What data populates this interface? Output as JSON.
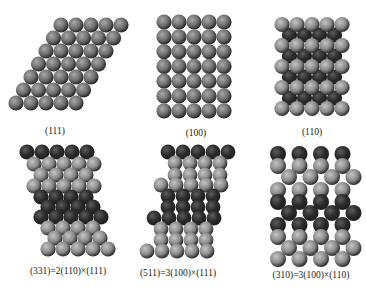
{
  "colors": {
    "background": "#ffffff",
    "atom_light": "#8a8a8a",
    "atom_light_hi": "#c4c4c4",
    "atom_mid": "#6e6e6e",
    "atom_mid_hi": "#a8a8a8",
    "atom_dark": "#2a2a2a",
    "atom_dark_hi": "#5c5c5c",
    "label": "#1a1a1a"
  },
  "panels": [
    {
      "id": "p111",
      "label": "(111)",
      "label_x": 55,
      "label_y": 126,
      "atom_radius": 7.6,
      "atoms": {
        "type": "hex",
        "rows": 7,
        "cols": 5,
        "x0": 61,
        "y0": 25,
        "dx": 15,
        "dy": 13,
        "row_shift": -7.5,
        "tone": "mid"
      }
    },
    {
      "id": "p100",
      "label": "(100)",
      "label_x": 196,
      "label_y": 128,
      "atom_radius": 7.6,
      "atoms": {
        "type": "square",
        "rows": 7,
        "cols": 5,
        "x0": 164,
        "y0": 22,
        "dx": 15,
        "dy": 14.8,
        "tone": "mid"
      }
    },
    {
      "id": "p110",
      "label": "(110)",
      "label_x": 312,
      "label_y": 127,
      "atom_radius": 7.6,
      "atoms": {
        "type": "layered",
        "under": {
          "rows": 4,
          "cols": 4,
          "x0": 289.5,
          "y0": 35,
          "dx": 15,
          "dy": 21,
          "tone": "dark"
        },
        "top": {
          "rows": 5,
          "cols": 5,
          "x0": 282,
          "y0": 24.5,
          "dx": 15,
          "dy": 21,
          "tone": "light"
        }
      }
    },
    {
      "id": "p331",
      "label": "(331)=2(110)×(111)",
      "label_x": 68,
      "label_y": 266,
      "atom_radius": 7.6,
      "atoms": {
        "type": "rows",
        "rows": [
          {
            "x0": 27,
            "y": 152,
            "n": 5,
            "tone": "dark"
          },
          {
            "x0": 34,
            "y": 164,
            "n": 5,
            "tone": "light"
          },
          {
            "x0": 41,
            "y": 175,
            "n": 4,
            "tone": "light"
          },
          {
            "x0": 34,
            "y": 186,
            "n": 5,
            "tone": "light"
          },
          {
            "x0": 41,
            "y": 197,
            "n": 4,
            "tone": "dark"
          },
          {
            "x0": 48,
            "y": 207,
            "n": 4,
            "tone": "dark"
          },
          {
            "x0": 41,
            "y": 217,
            "n": 5,
            "tone": "dark"
          },
          {
            "x0": 48,
            "y": 228,
            "n": 4,
            "tone": "light"
          },
          {
            "x0": 55,
            "y": 238,
            "n": 4,
            "tone": "light"
          },
          {
            "x0": 48,
            "y": 249,
            "n": 5,
            "tone": "light"
          }
        ]
      }
    },
    {
      "id": "p511",
      "label": "(511)=3(100)×(111)",
      "label_x": 178,
      "label_y": 268,
      "atom_radius": 7.4,
      "atoms": {
        "type": "rows",
        "rows": [
          {
            "x0": 168,
            "y": 152,
            "n": 5,
            "tone": "dark"
          },
          {
            "x0": 175,
            "y": 163,
            "n": 4,
            "tone": "light"
          },
          {
            "x0": 175,
            "y": 175,
            "n": 4,
            "tone": "light"
          },
          {
            "x0": 161,
            "y": 185,
            "n": 5,
            "tone": "light"
          },
          {
            "x0": 168,
            "y": 196,
            "n": 4,
            "tone": "dark"
          },
          {
            "x0": 168,
            "y": 207,
            "n": 4,
            "tone": "dark"
          },
          {
            "x0": 154,
            "y": 218,
            "n": 5,
            "tone": "dark"
          },
          {
            "x0": 161,
            "y": 229,
            "n": 4,
            "tone": "light"
          },
          {
            "x0": 161,
            "y": 240,
            "n": 4,
            "tone": "light"
          },
          {
            "x0": 147,
            "y": 251,
            "n": 5,
            "tone": "light"
          }
        ]
      }
    },
    {
      "id": "p310",
      "label": "(310)=3(100)×(110)",
      "label_x": 311,
      "label_y": 270,
      "atom_radius": 8,
      "atoms": {
        "type": "rows",
        "rows": [
          {
            "x0": 278,
            "y": 154,
            "n": 4,
            "tone": "dark",
            "dx": 21.5
          },
          {
            "x0": 278,
            "y": 166,
            "n": 4,
            "tone": "light",
            "dx": 21.5
          },
          {
            "x0": 289,
            "y": 177,
            "n": 4,
            "tone": "light",
            "dx": 21.5
          },
          {
            "x0": 278,
            "y": 190,
            "n": 4,
            "tone": "light",
            "dx": 21.5
          },
          {
            "x0": 278,
            "y": 202,
            "n": 4,
            "tone": "dark",
            "dx": 21.5
          },
          {
            "x0": 289,
            "y": 213,
            "n": 4,
            "tone": "dark",
            "dx": 21.5
          },
          {
            "x0": 278,
            "y": 225,
            "n": 4,
            "tone": "dark",
            "dx": 21.5
          },
          {
            "x0": 278,
            "y": 237,
            "n": 4,
            "tone": "light",
            "dx": 21.5
          },
          {
            "x0": 289,
            "y": 248,
            "n": 4,
            "tone": "light",
            "dx": 21.5
          },
          {
            "x0": 278,
            "y": 259,
            "n": 4,
            "tone": "light",
            "dx": 21.5
          }
        ]
      }
    }
  ]
}
